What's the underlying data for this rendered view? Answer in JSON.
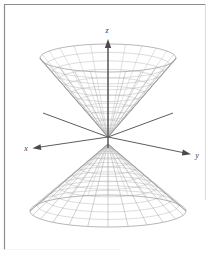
{
  "figure": {
    "background_color": "#ffffff",
    "border_color": "#8c8c8c",
    "mesh_color": "#a0a0a0",
    "mesh_color_light": "#c4c4c4",
    "axis_color": "#4a4a4a",
    "axis_labels": {
      "z": "z",
      "x": "x",
      "y": "y"
    },
    "origin": {
      "x": 108,
      "y": 137
    },
    "axes": [
      {
        "name": "z-axis",
        "label": "z",
        "label_x": 107,
        "label_y": 33,
        "from_x": 108,
        "from_y": 137,
        "to_x": 108,
        "to_y": 40,
        "arrow": true
      },
      {
        "name": "x-axis",
        "label": "x",
        "label_x": 26,
        "label_y": 151,
        "from_x": 108,
        "from_y": 137,
        "to_x": 34,
        "to_y": 148,
        "arrow": true
      },
      {
        "name": "y-axis",
        "label": "y",
        "label_x": 197,
        "label_y": 158,
        "from_x": 108,
        "from_y": 137,
        "to_x": 189,
        "to_y": 154,
        "arrow": true
      },
      {
        "name": "negative-y-axis",
        "label": "",
        "from_x": 108,
        "from_y": 137,
        "to_x": 43,
        "to_y": 113,
        "arrow": false
      },
      {
        "name": "negative-x-axis",
        "label": "",
        "from_x": 108,
        "from_y": 137,
        "to_x": 173,
        "to_y": 113,
        "arrow": false
      }
    ],
    "upper_cone": {
      "name": "upper-nappe",
      "apex_x": 108,
      "apex_y": 137,
      "rim_center_y": 58,
      "rim_rx": 68,
      "rim_ry": 14,
      "meridians": 24,
      "rings": 11
    },
    "lower_cone": {
      "name": "lower-nappe",
      "apex_x": 108,
      "apex_y": 144,
      "rim_center_y": 211,
      "rim_rx": 78,
      "rim_ry": 16,
      "meridians": 24,
      "rings": 11
    }
  },
  "chart_data": {
    "type": "line",
    "xlabel": "x",
    "ylabel": "y",
    "zlabel": "z",
    "surface": "double cone (two nappes) meeting at the origin",
    "series": [
      {
        "name": "upper nappe",
        "description": "cone opening upward from origin"
      },
      {
        "name": "lower nappe",
        "description": "cone opening downward from origin"
      }
    ],
    "annotations": [
      "z",
      "x",
      "y"
    ],
    "grid": true,
    "legend": "none"
  }
}
